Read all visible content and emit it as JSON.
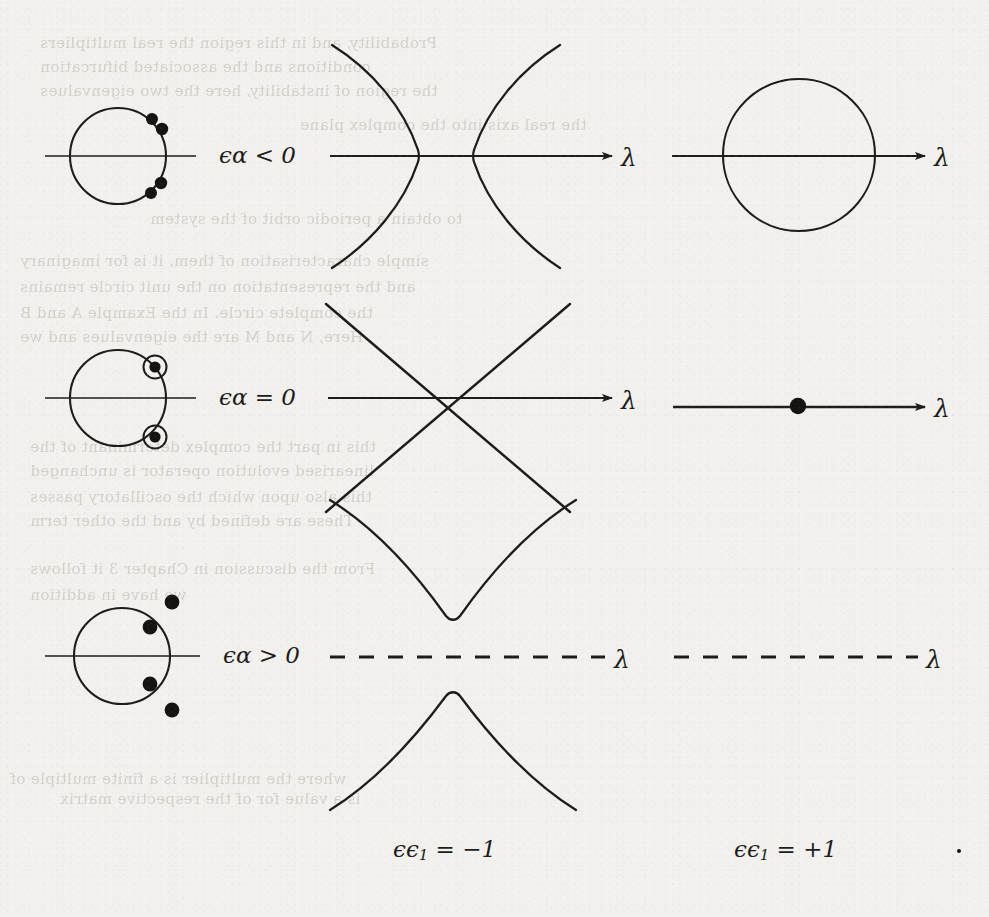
{
  "figure": {
    "background_color": "#f2f1ee",
    "ink_color": "#1d1c1b",
    "rows": [
      {
        "id": "row-1",
        "condition_label": "ϵα < 0",
        "left_panel": {
          "kind": "unit-circle",
          "description": "unit circle with four plain multiplier dots off the circle near upper-right and lower-right",
          "dots": [
            {
              "x": 0.62,
              "y": 0.78,
              "style": "plain"
            },
            {
              "x": 0.77,
              "y": 0.63,
              "style": "plain"
            },
            {
              "x": 0.77,
              "y": -0.63,
              "style": "plain"
            },
            {
              "x": 0.62,
              "y": -0.8,
              "style": "plain"
            }
          ]
        },
        "middle_panel": {
          "kind": "hyperbola-horizontal",
          "axis": "solid",
          "axis_label": "λ",
          "arrow": true
        },
        "right_panel": {
          "kind": "circle-on-axis",
          "axis": "solid",
          "axis_label": "λ",
          "arrow": true
        }
      },
      {
        "id": "row-2",
        "condition_label": "ϵα = 0",
        "left_panel": {
          "kind": "unit-circle",
          "description": "unit circle with two ringed (double) multipliers on the circle",
          "dots": [
            {
              "x": 0.7,
              "y": 0.71,
              "style": "ringed"
            },
            {
              "x": 0.7,
              "y": -0.71,
              "style": "ringed"
            }
          ]
        },
        "middle_panel": {
          "kind": "crossing-lines",
          "axis": "solid",
          "axis_label": "λ",
          "arrow": true
        },
        "right_panel": {
          "kind": "axis-with-dot",
          "axis": "solid",
          "axis_label": "λ",
          "arrow": true
        }
      },
      {
        "id": "row-3",
        "condition_label": "ϵα > 0",
        "left_panel": {
          "kind": "unit-circle",
          "description": "unit circle with two multipliers inside and two outside",
          "dots": [
            {
              "x": 0.98,
              "y": 1.2,
              "style": "plain"
            },
            {
              "x": 0.56,
              "y": 0.62,
              "style": "plain"
            },
            {
              "x": 0.56,
              "y": -0.62,
              "style": "plain"
            },
            {
              "x": 0.98,
              "y": -1.22,
              "style": "plain"
            }
          ]
        },
        "middle_panel": {
          "kind": "hyperbola-vertical",
          "axis": "dashed",
          "axis_label": "λ",
          "arrow": false
        },
        "right_panel": {
          "kind": "dashed-axis",
          "axis": "dashed",
          "axis_label": "λ",
          "arrow": false
        }
      }
    ],
    "column_captions": [
      {
        "id": "caption-left",
        "text": "ϵϵ",
        "sub": "1",
        "rest": " = −1"
      },
      {
        "id": "caption-right",
        "text": "ϵϵ",
        "sub": "1",
        "rest": " = +1"
      }
    ],
    "axis_symbol": "λ",
    "bleed_through_text": [
      {
        "text": "Probability, and in this region the real multipliers",
        "x": 40,
        "y": 34
      },
      {
        "text": "conditions and the associated bifurcation",
        "x": 40,
        "y": 58
      },
      {
        "text": "the region of instability, here the two eigenvalues",
        "x": 40,
        "y": 82
      },
      {
        "text": "the real axis into the complex plane",
        "x": 300,
        "y": 116
      },
      {
        "text": "to obtain a periodic orbit of the system",
        "x": 150,
        "y": 210
      },
      {
        "text": "simple characterisation of them, it is for imaginary",
        "x": 20,
        "y": 252
      },
      {
        "text": "and the representation on the unit circle remains",
        "x": 20,
        "y": 278
      },
      {
        "text": "the complete circle. In the Example A and B",
        "x": 20,
        "y": 304
      },
      {
        "text": "Here, N and M are the eigenvalues and we",
        "x": 20,
        "y": 328
      },
      {
        "text": "this in part the complex determinant of the",
        "x": 30,
        "y": 438
      },
      {
        "text": "linearised evolution operator is unchanged",
        "x": 30,
        "y": 462
      },
      {
        "text": "this also upon which the oscillatory passes",
        "x": 30,
        "y": 488
      },
      {
        "text": "These are defined by and the other term",
        "x": 30,
        "y": 512
      },
      {
        "text": "From the discussion in Chapter 3 it follows",
        "x": 30,
        "y": 560
      },
      {
        "text": "we have in addition",
        "x": 30,
        "y": 586
      },
      {
        "text": "where the multiplier is a finite multiple of",
        "x": 10,
        "y": 770
      },
      {
        "text": "is a value for of the respective matrix",
        "x": 60,
        "y": 790
      }
    ]
  }
}
